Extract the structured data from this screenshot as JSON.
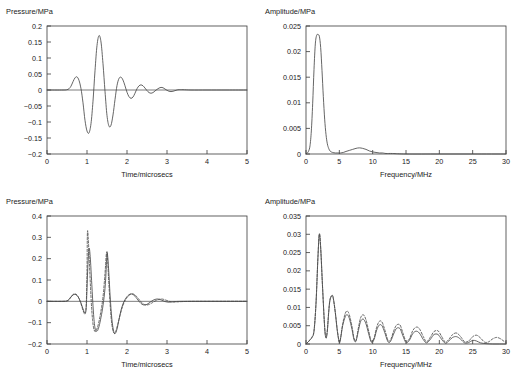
{
  "figure": {
    "width": 518,
    "height": 380,
    "background": "#ffffff",
    "line_color": "#4a4a4a",
    "axis_color": "#3a3a3a"
  },
  "chart_data": [
    {
      "id": "top-left",
      "type": "line",
      "title": "",
      "ylabel": "Pressure/MPa",
      "xlabel": "Time/microsecs",
      "xlim": [
        0,
        5
      ],
      "ylim": [
        -0.2,
        0.2
      ],
      "xticks": [
        0,
        1,
        2,
        3,
        4,
        5
      ],
      "xtick_labels": [
        "0",
        "1",
        "2",
        "3",
        "4",
        "5"
      ],
      "yticks": [
        -0.2,
        -0.15,
        -0.1,
        -0.05,
        0,
        0.05,
        0.1,
        0.15,
        0.2
      ],
      "ytick_labels": [
        "−0.2",
        "−0.15",
        "−0.1",
        "−0.05",
        "0",
        "0.05",
        "0.1",
        "0.15",
        "0.2"
      ],
      "grid": false,
      "legend": "none",
      "zero_line": true,
      "series": [
        {
          "name": "incident pressure pulse",
          "style": "solid",
          "x": [
            0.0,
            0.4,
            0.5,
            0.55,
            0.6,
            0.65,
            0.7,
            0.75,
            0.8,
            0.85,
            0.9,
            0.95,
            1.0,
            1.05,
            1.1,
            1.15,
            1.2,
            1.25,
            1.3,
            1.35,
            1.4,
            1.45,
            1.5,
            1.55,
            1.6,
            1.65,
            1.7,
            1.75,
            1.8,
            1.85,
            1.9,
            1.95,
            2.0,
            2.05,
            2.1,
            2.15,
            2.2,
            2.25,
            2.3,
            2.35,
            2.4,
            2.45,
            2.5,
            2.55,
            2.6,
            2.65,
            2.7,
            2.75,
            2.8,
            2.85,
            2.9,
            2.95,
            3.0,
            3.05,
            3.1,
            3.15,
            3.2,
            3.25,
            3.3,
            3.4,
            3.6,
            4.0,
            4.5,
            5.0
          ],
          "y": [
            0.0,
            0.0,
            0.001,
            0.004,
            0.012,
            0.026,
            0.038,
            0.041,
            0.03,
            0.004,
            -0.04,
            -0.095,
            -0.128,
            -0.134,
            -0.105,
            -0.035,
            0.06,
            0.139,
            0.17,
            0.15,
            0.082,
            -0.004,
            -0.08,
            -0.113,
            -0.11,
            -0.078,
            -0.03,
            0.014,
            0.036,
            0.04,
            0.031,
            0.013,
            -0.007,
            -0.021,
            -0.026,
            -0.022,
            -0.01,
            0.004,
            0.013,
            0.016,
            0.013,
            0.006,
            -0.002,
            -0.008,
            -0.01,
            -0.008,
            -0.003,
            0.002,
            0.006,
            0.008,
            0.007,
            0.003,
            -0.001,
            -0.004,
            -0.005,
            -0.004,
            -0.002,
            0.0,
            0.001,
            0.001,
            0.0,
            0.0,
            0.0,
            0.0
          ]
        }
      ]
    },
    {
      "id": "top-right",
      "type": "line",
      "title": "",
      "ylabel": "Amplitude/MPa",
      "xlabel": "Frequency/MHz",
      "xlim": [
        0,
        30
      ],
      "ylim": [
        0,
        0.025
      ],
      "xticks": [
        0,
        5,
        10,
        15,
        20,
        25,
        30
      ],
      "xtick_labels": [
        "0",
        "5",
        "10",
        "15",
        "20",
        "25",
        "30"
      ],
      "yticks": [
        0,
        0.005,
        0.01,
        0.015,
        0.02,
        0.025
      ],
      "ytick_labels": [
        "0",
        "0.005",
        "0.01",
        "0.015",
        "0.02",
        "0.025"
      ],
      "grid": false,
      "legend": "none",
      "zero_line": false,
      "series": [
        {
          "name": "spectrum of incident pulse",
          "style": "solid",
          "x": [
            0.0,
            0.2,
            0.4,
            0.6,
            0.8,
            1.0,
            1.2,
            1.4,
            1.6,
            1.8,
            2.0,
            2.2,
            2.4,
            2.6,
            2.8,
            3.0,
            3.2,
            3.4,
            3.6,
            3.8,
            4.0,
            4.4,
            4.8,
            5.2,
            5.6,
            6.0,
            6.5,
            7.0,
            7.5,
            8.0,
            8.5,
            9.0,
            9.5,
            10.0,
            10.5,
            11.0,
            11.5,
            12.0,
            13.0,
            15.0,
            20.0,
            25.0,
            30.0
          ],
          "y": [
            0.0,
            0.0002,
            0.0006,
            0.0016,
            0.0045,
            0.0098,
            0.0165,
            0.0215,
            0.0232,
            0.0233,
            0.023,
            0.0208,
            0.0163,
            0.0112,
            0.0068,
            0.0038,
            0.002,
            0.0011,
            0.0006,
            0.0004,
            0.0003,
            0.0002,
            0.0002,
            0.0002,
            0.0003,
            0.0005,
            0.0007,
            0.0009,
            0.0011,
            0.0012,
            0.0011,
            0.0009,
            0.0006,
            0.0004,
            0.0003,
            0.0002,
            0.0002,
            0.0001,
            0.0001,
            0.0,
            0.0,
            0.0,
            0.0
          ]
        }
      ]
    },
    {
      "id": "bottom-left",
      "type": "line",
      "title": "",
      "ylabel": "Pressure/MPa",
      "xlabel": "Time/microsecs",
      "xlim": [
        0,
        5
      ],
      "ylim": [
        -0.2,
        0.4
      ],
      "xticks": [
        0,
        1,
        2,
        3,
        4,
        5
      ],
      "xtick_labels": [
        "0",
        "1",
        "2",
        "3",
        "4",
        "5"
      ],
      "yticks": [
        -0.2,
        -0.1,
        0,
        0.1,
        0.2,
        0.3,
        0.4
      ],
      "ytick_labels": [
        "−0.2",
        "−0.1",
        "0",
        "0.1",
        "0.2",
        "0.3",
        "0.4"
      ],
      "grid": false,
      "legend": "none",
      "zero_line": true,
      "series": [
        {
          "name": "measured reflected pressure",
          "style": "solid",
          "x": [
            0.0,
            0.4,
            0.5,
            0.55,
            0.6,
            0.65,
            0.7,
            0.75,
            0.8,
            0.85,
            0.9,
            0.95,
            0.98,
            1.0,
            1.02,
            1.05,
            1.08,
            1.12,
            1.16,
            1.2,
            1.25,
            1.3,
            1.35,
            1.4,
            1.45,
            1.48,
            1.5,
            1.52,
            1.55,
            1.58,
            1.62,
            1.66,
            1.7,
            1.75,
            1.8,
            1.85,
            1.9,
            1.95,
            2.0,
            2.05,
            2.1,
            2.15,
            2.2,
            2.25,
            2.3,
            2.35,
            2.4,
            2.45,
            2.5,
            2.55,
            2.6,
            2.65,
            2.7,
            2.75,
            2.8,
            2.85,
            2.9,
            2.95,
            3.0,
            3.05,
            3.1,
            3.2,
            3.4,
            3.8,
            4.4,
            5.0
          ],
          "y": [
            0.0,
            0.0,
            0.002,
            0.008,
            0.02,
            0.03,
            0.033,
            0.028,
            0.014,
            -0.008,
            -0.035,
            -0.055,
            -0.03,
            0.06,
            0.16,
            0.247,
            0.21,
            0.08,
            -0.05,
            -0.125,
            -0.14,
            -0.118,
            -0.075,
            -0.02,
            0.06,
            0.15,
            0.225,
            0.205,
            0.12,
            0.02,
            -0.08,
            -0.135,
            -0.152,
            -0.13,
            -0.085,
            -0.042,
            -0.012,
            0.008,
            0.022,
            0.031,
            0.035,
            0.032,
            0.024,
            0.012,
            0.0,
            -0.01,
            -0.016,
            -0.017,
            -0.014,
            -0.008,
            -0.001,
            0.005,
            0.009,
            0.011,
            0.01,
            0.007,
            0.003,
            -0.001,
            -0.003,
            -0.004,
            -0.003,
            -0.001,
            0.0,
            0.0,
            0.0,
            0.0
          ]
        },
        {
          "name": "predicted reflected pressure",
          "style": "dashed",
          "x": [
            0.0,
            0.4,
            0.5,
            0.55,
            0.6,
            0.65,
            0.7,
            0.75,
            0.8,
            0.85,
            0.9,
            0.95,
            0.98,
            1.0,
            1.01,
            1.03,
            1.06,
            1.1,
            1.14,
            1.18,
            1.22,
            1.28,
            1.34,
            1.4,
            1.45,
            1.48,
            1.5,
            1.51,
            1.53,
            1.56,
            1.6,
            1.64,
            1.68,
            1.72,
            1.78,
            1.84,
            1.9,
            1.96,
            2.02,
            2.08,
            2.14,
            2.2,
            2.26,
            2.32,
            2.38,
            2.44,
            2.5,
            2.56,
            2.62,
            2.68,
            2.74,
            2.8,
            2.86,
            2.92,
            2.98,
            3.04,
            3.1,
            3.2,
            3.4,
            3.8,
            4.4,
            5.0
          ],
          "y": [
            0.0,
            0.0,
            0.002,
            0.009,
            0.022,
            0.032,
            0.035,
            0.029,
            0.013,
            -0.012,
            -0.042,
            -0.06,
            -0.02,
            0.14,
            0.32,
            0.3,
            0.18,
            0.02,
            -0.09,
            -0.135,
            -0.14,
            -0.11,
            -0.055,
            0.02,
            0.13,
            0.215,
            0.233,
            0.215,
            0.14,
            0.04,
            -0.07,
            -0.13,
            -0.15,
            -0.14,
            -0.1,
            -0.055,
            -0.018,
            0.006,
            0.022,
            0.032,
            0.035,
            0.03,
            0.018,
            0.004,
            -0.008,
            -0.015,
            -0.017,
            -0.014,
            -0.008,
            -0.001,
            0.005,
            0.009,
            0.011,
            0.009,
            0.005,
            0.001,
            -0.002,
            -0.003,
            -0.001,
            0.0,
            0.0,
            0.0
          ]
        }
      ]
    },
    {
      "id": "bottom-right",
      "type": "line",
      "title": "",
      "ylabel": "Amplitude/MPa",
      "xlabel": "Frequency/MHz",
      "xlim": [
        0,
        30
      ],
      "ylim": [
        0,
        0.035
      ],
      "xticks": [
        0,
        5,
        10,
        15,
        20,
        25,
        30
      ],
      "xtick_labels": [
        "0",
        "5",
        "10",
        "15",
        "20",
        "25",
        "30"
      ],
      "yticks": [
        0,
        0.005,
        0.01,
        0.015,
        0.02,
        0.025,
        0.03,
        0.035
      ],
      "ytick_labels": [
        "0",
        "0.005",
        "0.01",
        "0.015",
        "0.02",
        "0.025",
        "0.03",
        "0.035"
      ],
      "grid": false,
      "legend": "none",
      "zero_line": false,
      "series": [
        {
          "name": "spectrum of measured reflection",
          "style": "solid",
          "x": [
            0.0,
            0.3,
            0.6,
            0.9,
            1.2,
            1.5,
            1.8,
            2.0,
            2.2,
            2.5,
            2.8,
            3.0,
            3.2,
            3.4,
            3.6,
            3.9,
            4.1,
            4.4,
            4.7,
            5.0,
            5.2,
            5.5,
            5.9,
            6.2,
            6.5,
            6.9,
            7.2,
            7.5,
            7.9,
            8.2,
            8.6,
            9.0,
            9.4,
            9.8,
            10.2,
            10.6,
            11.0,
            11.4,
            11.8,
            12.3,
            12.7,
            13.2,
            13.6,
            14.1,
            14.5,
            15.0,
            15.5,
            16.0,
            16.5,
            17.0,
            17.6,
            18.1,
            18.7,
            19.2,
            19.8,
            20.3,
            20.9,
            21.4,
            22.0,
            22.6,
            23.2,
            23.8,
            24.4,
            25.0,
            25.6,
            26.2,
            27.0,
            28.0,
            29.0,
            30.0
          ],
          "y": [
            0.0,
            0.0005,
            0.0011,
            0.0018,
            0.0035,
            0.011,
            0.024,
            0.0301,
            0.0265,
            0.015,
            0.0045,
            0.0016,
            0.0035,
            0.0085,
            0.012,
            0.0133,
            0.0125,
            0.0085,
            0.0035,
            0.0004,
            0.0016,
            0.005,
            0.0075,
            0.008,
            0.007,
            0.004,
            0.0012,
            0.0008,
            0.004,
            0.0062,
            0.0068,
            0.0055,
            0.0028,
            0.0005,
            0.0012,
            0.0038,
            0.0052,
            0.005,
            0.0032,
            0.0006,
            0.0008,
            0.003,
            0.0043,
            0.0042,
            0.0024,
            0.0004,
            0.001,
            0.0028,
            0.0035,
            0.003,
            0.0012,
            0.0003,
            0.0014,
            0.0026,
            0.0026,
            0.0014,
            0.0002,
            0.0008,
            0.0018,
            0.002,
            0.0013,
            0.0003,
            0.0004,
            0.001,
            0.0008,
            0.0003,
            0.0001,
            0.0,
            0.0,
            0.0
          ]
        },
        {
          "name": "spectrum of predicted reflection",
          "style": "dashed",
          "x": [
            0.0,
            0.3,
            0.6,
            0.9,
            1.2,
            1.5,
            1.8,
            2.0,
            2.2,
            2.5,
            2.8,
            3.0,
            3.2,
            3.4,
            3.6,
            3.9,
            4.1,
            4.4,
            4.7,
            5.0,
            5.2,
            5.5,
            5.9,
            6.2,
            6.5,
            6.9,
            7.2,
            7.5,
            7.9,
            8.2,
            8.6,
            9.0,
            9.4,
            9.8,
            10.2,
            10.6,
            11.0,
            11.4,
            11.8,
            12.3,
            12.7,
            13.2,
            13.6,
            14.1,
            14.5,
            15.0,
            15.5,
            16.0,
            16.5,
            17.0,
            17.6,
            18.1,
            18.7,
            19.2,
            19.8,
            20.3,
            20.9,
            21.4,
            22.0,
            22.6,
            23.2,
            23.8,
            24.4,
            25.0,
            25.6,
            26.2,
            26.8,
            27.4,
            28.0,
            28.6,
            29.2,
            29.8,
            30.0
          ],
          "y": [
            0.0,
            0.0005,
            0.0012,
            0.0019,
            0.0036,
            0.0112,
            0.0242,
            0.03,
            0.0262,
            0.0148,
            0.0046,
            0.0018,
            0.0038,
            0.0088,
            0.0122,
            0.0132,
            0.0124,
            0.0086,
            0.0038,
            0.0006,
            0.0018,
            0.0055,
            0.0084,
            0.009,
            0.008,
            0.0048,
            0.0016,
            0.001,
            0.0048,
            0.0072,
            0.008,
            0.0066,
            0.0036,
            0.0008,
            0.0016,
            0.0046,
            0.0062,
            0.006,
            0.004,
            0.001,
            0.0012,
            0.0038,
            0.0052,
            0.0052,
            0.0032,
            0.0008,
            0.0014,
            0.0036,
            0.0046,
            0.0042,
            0.002,
            0.0006,
            0.002,
            0.0034,
            0.0036,
            0.0022,
            0.0005,
            0.0012,
            0.0026,
            0.003,
            0.002,
            0.0006,
            0.0008,
            0.002,
            0.0024,
            0.0016,
            0.0005,
            0.0006,
            0.0014,
            0.0018,
            0.0014,
            0.0006,
            0.0005
          ]
        }
      ]
    }
  ]
}
